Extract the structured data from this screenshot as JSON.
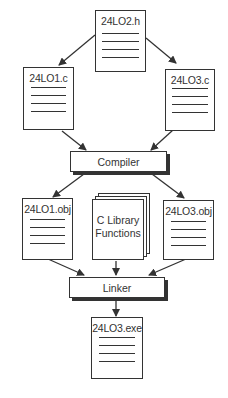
{
  "diagram": {
    "type": "build-process-flowchart",
    "nodes": {
      "header": {
        "label": "24LO2.h",
        "kind": "document"
      },
      "source1": {
        "label": "24LO1.c",
        "kind": "document"
      },
      "source3": {
        "label": "24LO3.c",
        "kind": "document"
      },
      "compiler": {
        "label": "Compiler",
        "kind": "process"
      },
      "obj1": {
        "label": "24LO1.obj",
        "kind": "document"
      },
      "library": {
        "label_line1": "C Library",
        "label_line2": "Functions",
        "kind": "document-stack"
      },
      "obj3": {
        "label": "24LO3.obj",
        "kind": "document"
      },
      "linker": {
        "label": "Linker",
        "kind": "process"
      },
      "exe": {
        "label": "24LO3.exe",
        "kind": "document"
      }
    },
    "edges": [
      {
        "from": "24LO2.h",
        "to": "24LO1.c"
      },
      {
        "from": "24LO2.h",
        "to": "24LO3.c"
      },
      {
        "from": "24LO1.c",
        "to": "Compiler"
      },
      {
        "from": "24LO3.c",
        "to": "Compiler"
      },
      {
        "from": "Compiler",
        "to": "24LO1.obj"
      },
      {
        "from": "Compiler",
        "to": "24LO3.obj"
      },
      {
        "from": "24LO1.obj",
        "to": "Linker"
      },
      {
        "from": "C Library Functions",
        "to": "Linker"
      },
      {
        "from": "24LO3.obj",
        "to": "Linker"
      },
      {
        "from": "Linker",
        "to": "24LO3.exe"
      }
    ],
    "colors": {
      "stroke": "#333333",
      "background": "#ffffff"
    }
  }
}
